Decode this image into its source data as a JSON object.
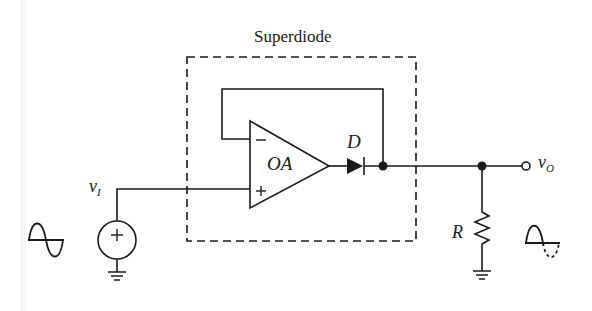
{
  "diagram": {
    "title": "Superdiode",
    "type": "circuit-schematic",
    "components": {
      "opamp": {
        "label": "OA",
        "inverting_symbol": "−",
        "noninverting_symbol": "+"
      },
      "diode": {
        "label": "D"
      },
      "resistor": {
        "label": "R"
      },
      "source": {
        "polarity_symbol": "+"
      }
    },
    "labels": {
      "input_main": "v",
      "input_sub": "I",
      "output_main": "v",
      "output_sub": "O"
    },
    "waveforms": {
      "input": "full sine wave",
      "output": "half-wave rectified sine (negative half dashed)"
    },
    "colors": {
      "line": "#1a1a1a",
      "background": "#ffffff"
    }
  }
}
